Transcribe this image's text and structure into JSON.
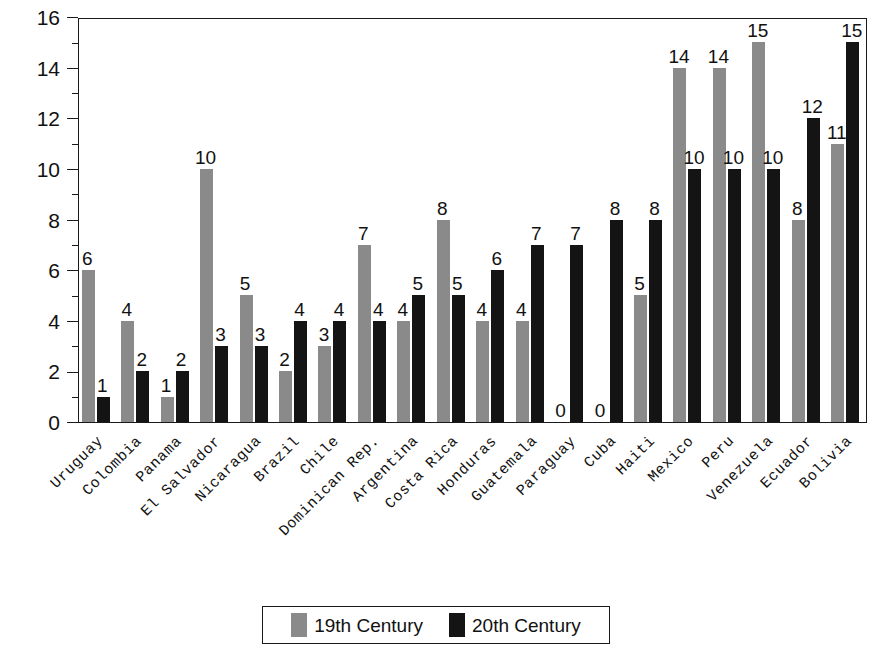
{
  "chart_data": {
    "type": "bar",
    "title": "",
    "subtitle": "",
    "xlabel": "",
    "ylabel": "Number of Cases",
    "ylim": [
      0,
      16
    ],
    "ytick_step": 2,
    "yticks": [
      0,
      2,
      4,
      6,
      8,
      10,
      12,
      14,
      16
    ],
    "ytick_labels": [
      "0",
      "2",
      "4",
      "6",
      "8",
      "10",
      "12",
      "14",
      "16"
    ],
    "minor_ticks": [
      1,
      3,
      5,
      7,
      9,
      11,
      13,
      15
    ],
    "grid": false,
    "legend_position": "bottom-center",
    "bar_value_labels": true,
    "categories": [
      "Uruguay",
      "Colombia",
      "Panama",
      "El Salvador",
      "Nicaragua",
      "Brazil",
      "Chile",
      "Dominican Rep.",
      "Argentina",
      "Costa Rica",
      "Honduras",
      "Guatemala",
      "Paraguay",
      "Cuba",
      "Haiti",
      "Mexico",
      "Peru",
      "Venezuela",
      "Ecuador",
      "Bolivia"
    ],
    "series": [
      {
        "name": "19th Century",
        "color": "#8a8a8a",
        "values": [
          6,
          4,
          1,
          10,
          5,
          2,
          3,
          7,
          4,
          8,
          4,
          4,
          0,
          0,
          5,
          14,
          14,
          15,
          8,
          11
        ]
      },
      {
        "name": "20th Century",
        "color": "#141414",
        "values": [
          1,
          2,
          2,
          3,
          3,
          4,
          4,
          4,
          5,
          5,
          6,
          7,
          7,
          8,
          8,
          10,
          10,
          10,
          12,
          15
        ]
      }
    ]
  },
  "legend": {
    "entries": [
      {
        "label": "19th Century",
        "color": "#8a8a8a"
      },
      {
        "label": "20th Century",
        "color": "#141414"
      }
    ]
  }
}
